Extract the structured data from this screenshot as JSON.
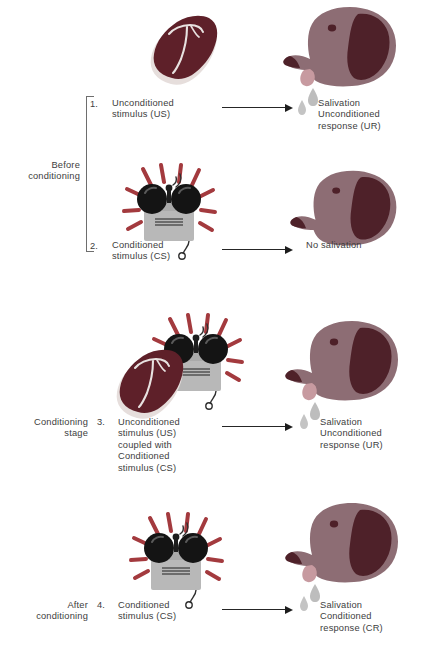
{
  "figure": {
    "background_color": "#ffffff"
  },
  "palette": {
    "meat_dark": "#5e2029",
    "meat_fat": "#e6dedc",
    "meat_bone": "#efe9e7",
    "dog_body": "#8d6d74",
    "dog_ear": "#4e2129",
    "dog_nose": "#4e2129",
    "dog_tongue": "#c79aa0",
    "bell_body": "#b8b8b8",
    "bell_bell": "#141414",
    "ray_red": "#a33a3e",
    "drop_gray": "#b9b9b9",
    "text": "#3d3d3d",
    "arrow": "#1d1d1d",
    "bracket": "#6e6e6e"
  },
  "stages": [
    {
      "id": "before-conditioning",
      "label": "Before\nconditioning",
      "bracket": true
    },
    {
      "id": "conditioning-stage",
      "label": "Conditioning\nstage",
      "bracket": false
    },
    {
      "id": "after-conditioning",
      "label": "After\nconditioning",
      "bracket": false
    }
  ],
  "panels": [
    {
      "id": "panel-1",
      "number": "1.",
      "stimulus_icons": [
        "meat-icon"
      ],
      "stimulus_label": "Unconditioned\nstimulus (US)",
      "arrow": "arrow-right",
      "dog": "dog-salivating",
      "drops": 2,
      "response_label": "Salivation\nUnconditioned\nresponse (UR)"
    },
    {
      "id": "panel-2",
      "number": "2.",
      "stimulus_icons": [
        "bell-icon"
      ],
      "stimulus_label": "Conditioned\nstimulus (CS)",
      "arrow": "arrow-right",
      "dog": "dog-neutral",
      "drops": 0,
      "response_label": "No salivation"
    },
    {
      "id": "panel-3",
      "number": "3.",
      "stimulus_icons": [
        "meat-icon",
        "bell-icon"
      ],
      "stimulus_label": "Unconditioned\nstimulus (US)\ncoupled with\nConditioned\nstimulus (CS)",
      "arrow": "arrow-right",
      "dog": "dog-salivating",
      "drops": 2,
      "response_label": "Salivation\nUnconditioned\nresponse (UR)"
    },
    {
      "id": "panel-4",
      "number": "4.",
      "stimulus_icons": [
        "bell-icon"
      ],
      "stimulus_label": "Conditioned\nstimulus (CS)",
      "arrow": "arrow-right",
      "dog": "dog-salivating",
      "drops": 2,
      "response_label": "Salivation\nConditioned\nresponse (CR)"
    }
  ]
}
